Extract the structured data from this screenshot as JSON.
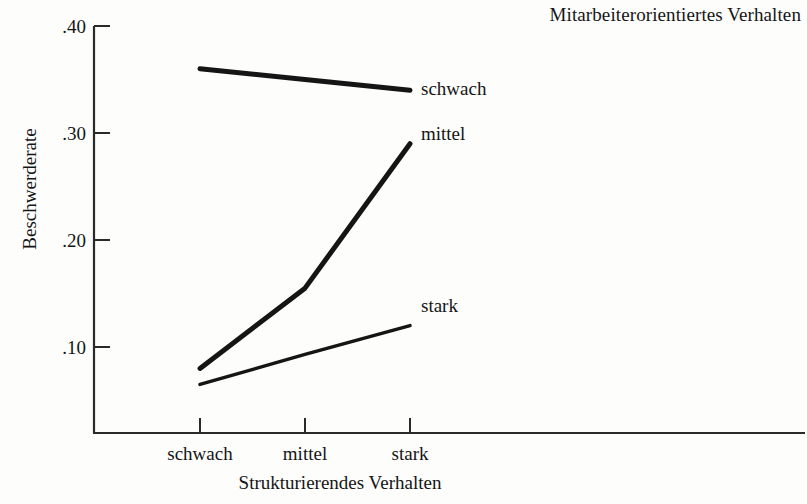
{
  "figure": {
    "title": "Mitarbeiterorientiertes Verhalten",
    "y_axis_title": "Beschwerderate",
    "x_axis_title": "Strukturierendes Verhalten"
  },
  "axes": {
    "y_ticks": [
      ".40",
      ".30",
      ".20",
      ".10"
    ],
    "x_ticks": [
      "schwach",
      "mittel",
      "stark"
    ]
  },
  "series_labels": {
    "schwach": "schwach",
    "mittel": "mittel",
    "stark": "stark"
  },
  "colors": {
    "ink": "#151515",
    "paper": "#fdfdfc",
    "axis": "#2a2a2a"
  },
  "chart_data": {
    "type": "line",
    "title": "Mitarbeiterorientiertes Verhalten",
    "subtitle": "",
    "xlabel": "Strukturierendes Verhalten",
    "ylabel": "Beschwerderate",
    "categories": [
      "schwach",
      "mittel",
      "stark"
    ],
    "ylim": [
      0.0,
      0.4
    ],
    "yticks": [
      0.1,
      0.2,
      0.3,
      0.4
    ],
    "ytick_labels": [
      ".10",
      ".20",
      ".30",
      ".40"
    ],
    "grid": false,
    "legend": "right-inline-labels",
    "series": [
      {
        "name": "schwach",
        "values": [
          0.36,
          0.35,
          0.34
        ],
        "linewidth": "thick"
      },
      {
        "name": "mittel",
        "values": [
          0.08,
          0.155,
          0.29
        ],
        "linewidth": "thick"
      },
      {
        "name": "stark",
        "values": [
          0.065,
          0.093,
          0.12
        ],
        "linewidth": "medium"
      }
    ],
    "annotations": [
      {
        "text": "schwach",
        "at": [
          "stark",
          0.34
        ]
      },
      {
        "text": "mittel",
        "at": [
          "stark",
          0.29
        ]
      },
      {
        "text": "stark",
        "at": [
          "stark",
          0.12
        ]
      }
    ]
  }
}
